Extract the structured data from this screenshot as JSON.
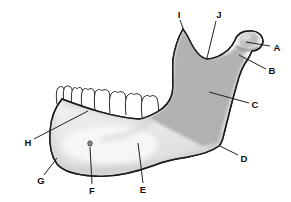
{
  "figure": {
    "type": "labeled-anatomy-diagram",
    "colors": {
      "background": "#ffffff",
      "outline": "#1c1c1c",
      "body_light": "#f4f4f4",
      "body_shade": "#dcdcdc",
      "ramus_dark": "#aeaeae",
      "leader_line": "#222222",
      "label_text": "#111111"
    },
    "labels": [
      {
        "letter": "A",
        "x": 277,
        "y": 47,
        "line": {
          "x1": 270,
          "y1": 46,
          "x2": 246,
          "y2": 42
        }
      },
      {
        "letter": "B",
        "x": 272,
        "y": 70,
        "line": {
          "x1": 266,
          "y1": 69,
          "x2": 239,
          "y2": 55
        }
      },
      {
        "letter": "C",
        "x": 255,
        "y": 104,
        "line": {
          "x1": 249,
          "y1": 103,
          "x2": 209,
          "y2": 92
        }
      },
      {
        "letter": "D",
        "x": 244,
        "y": 158,
        "line": {
          "x1": 238,
          "y1": 155,
          "x2": 220,
          "y2": 146
        }
      },
      {
        "letter": "E",
        "x": 143,
        "y": 189,
        "line": {
          "x1": 143,
          "y1": 183,
          "x2": 138,
          "y2": 143
        }
      },
      {
        "letter": "F",
        "x": 92,
        "y": 190,
        "line": {
          "x1": 92,
          "y1": 184,
          "x2": 90,
          "y2": 147
        }
      },
      {
        "letter": "G",
        "x": 41,
        "y": 180,
        "line": {
          "x1": 44,
          "y1": 175,
          "x2": 57,
          "y2": 158
        }
      },
      {
        "letter": "H",
        "x": 28,
        "y": 142,
        "line": {
          "x1": 34,
          "y1": 139,
          "x2": 88,
          "y2": 111
        }
      },
      {
        "letter": "I",
        "x": 179,
        "y": 14,
        "line": {
          "x1": 180,
          "y1": 20,
          "x2": 183,
          "y2": 28
        }
      },
      {
        "letter": "J",
        "x": 219,
        "y": 14,
        "line": {
          "x1": 216,
          "y1": 21,
          "x2": 207,
          "y2": 58
        }
      }
    ]
  }
}
